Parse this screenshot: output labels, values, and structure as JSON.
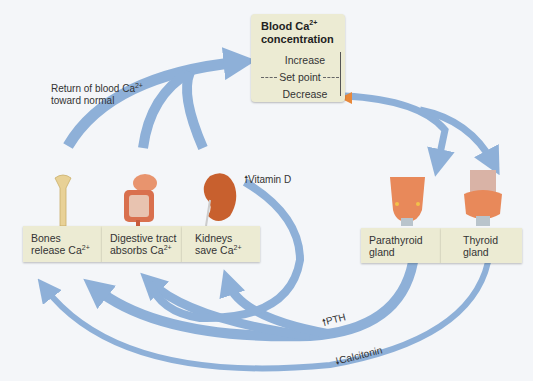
{
  "center": {
    "title_line1": "Blood Ca",
    "title_sup": "2+",
    "title_line2": "concentration",
    "increase": "Increase",
    "set_point": "Set point",
    "decrease": "Decrease"
  },
  "return_label": {
    "line1": "Return of blood Ca",
    "sup": "2+",
    "line2": "toward normal"
  },
  "effectors": [
    {
      "line1": "Bones",
      "line2": "release Ca",
      "sup": "2+",
      "organ": "bone-icon"
    },
    {
      "line1": "Digestive tract",
      "line2": "absorbs Ca",
      "sup": "2+",
      "organ": "intestine-icon"
    },
    {
      "line1": "Kidneys",
      "line2": "save Ca",
      "sup": "2+",
      "organ": "kidney-icon"
    }
  ],
  "glands": [
    {
      "line1": "Parathyroid",
      "line2": "gland",
      "organ": "parathyroid-icon"
    },
    {
      "line1": "Thyroid",
      "line2": "gland",
      "organ": "thyroid-icon"
    }
  ],
  "hormones": {
    "vitamin_d": "Vitamin D",
    "pth": "PTH",
    "calcitonin": "Calcitonin"
  },
  "colors": {
    "arrow": "#8eb0d8",
    "box": "#ecebd3",
    "marker": "#e8883a"
  }
}
